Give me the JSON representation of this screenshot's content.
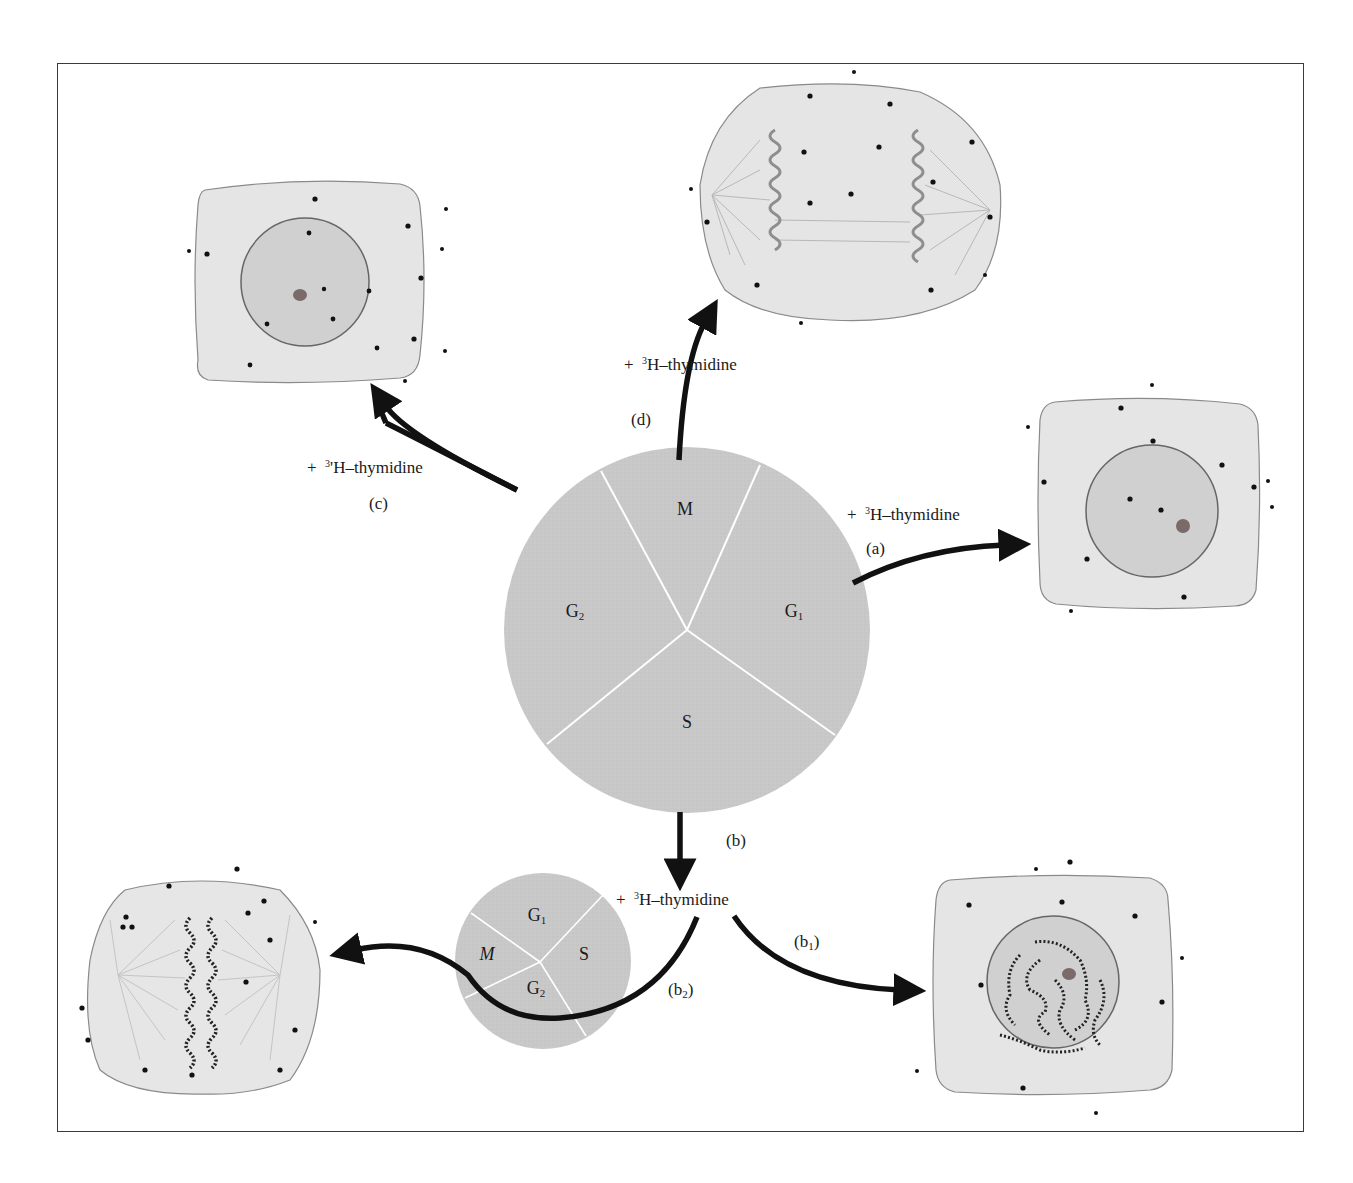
{
  "figure": {
    "reagent_prefix": "+",
    "isotope_superscript": "3",
    "isotope_label": "H–thymidine",
    "colors": {
      "pie_fill": "#c9c9c9",
      "pie_divider": "#ffffff",
      "cell_fill": "#e6e6e6",
      "cell_outline": "#8a8a8a",
      "nucleus_fill": "#d2d2d2",
      "nucleus_outline": "#6a6a6a",
      "arrow": "#111111",
      "grain": "#111111",
      "frame": "#3a3a3a"
    }
  },
  "main_cycle": {
    "phases": [
      {
        "id": "M",
        "label": "M",
        "sub": ""
      },
      {
        "id": "G1",
        "label": "G",
        "sub": "1"
      },
      {
        "id": "S",
        "label": "S",
        "sub": ""
      },
      {
        "id": "G2",
        "label": "G",
        "sub": "2"
      }
    ]
  },
  "small_cycle": {
    "phases": [
      {
        "id": "G1",
        "label": "G",
        "sub": "1"
      },
      {
        "id": "M",
        "label": "M",
        "sub": ""
      },
      {
        "id": "S",
        "label": "S",
        "sub": ""
      },
      {
        "id": "G2",
        "label": "G",
        "sub": "2"
      }
    ]
  },
  "branches": {
    "a": {
      "tag": "(a)",
      "reagent": "H–thymidine",
      "target": "interphase cell, unlabeled nucleus (G1)"
    },
    "b": {
      "tag": "(b)",
      "reagent": "H–thymidine"
    },
    "b1": {
      "tag": "(b",
      "tag_sub": "1",
      "tag_close": ")",
      "target": "interphase cell with labeled chromatin"
    },
    "b2": {
      "tag": "(b",
      "tag_sub": "2",
      "tag_close": ")",
      "target": "metaphase cell with labeled chromosomes"
    },
    "c": {
      "tag": "(c)",
      "reagent": "'H–thymidine",
      "target": "interphase cell, unlabeled nucleus (G2)"
    },
    "d": {
      "tag": "(d)",
      "reagent": "H–thymidine",
      "target": "anaphase cell, unlabeled chromosomes"
    }
  }
}
